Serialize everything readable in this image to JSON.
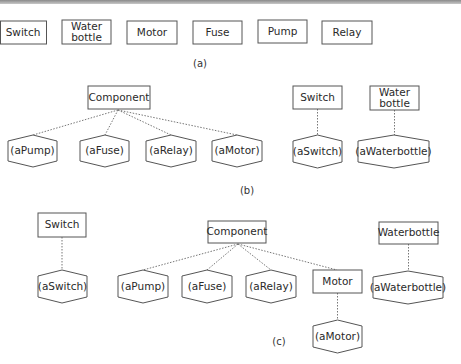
{
  "panel_a": {
    "caption": "(a)",
    "classes": [
      {
        "line1": "Switch",
        "line2": ""
      },
      {
        "line1": "Water",
        "line2": "bottle"
      },
      {
        "line1": "Motor",
        "line2": ""
      },
      {
        "line1": "Fuse",
        "line2": ""
      },
      {
        "line1": "Pump",
        "line2": ""
      },
      {
        "line1": "Relay",
        "line2": ""
      }
    ]
  },
  "panel_b": {
    "caption": "(b)",
    "component": "Component",
    "component_instances": [
      "(aPump)",
      "(aFuse)",
      "(aRelay)",
      "(aMotor)"
    ],
    "switch_class": "Switch",
    "switch_instance": "(aSwitch)",
    "waterbottle_class": {
      "line1": "Water",
      "line2": "bottle"
    },
    "waterbottle_instance": "(aWaterbottle)"
  },
  "panel_c": {
    "caption": "(c)",
    "switch_class": "Switch",
    "switch_instance": "(aSwitch)",
    "component": "Component",
    "component_instances": [
      "(aPump)",
      "(aFuse)",
      "(aRelay)"
    ],
    "motor_class": "Motor",
    "motor_instance": "(aMotor)",
    "waterbottle_class": "Waterbottle",
    "waterbottle_instance": "(aWaterbottle)"
  },
  "colors": {
    "stroke": "#555555",
    "text": "#2a2a2a",
    "background": "#ffffff"
  }
}
